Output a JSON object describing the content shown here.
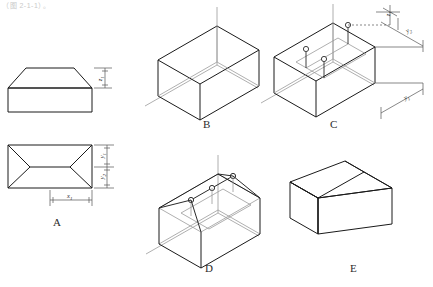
{
  "header": {
    "faint_text": "（图 2-1-1）。"
  },
  "diagram": {
    "stroke_color": "#1a1a1a",
    "light_stroke_color": "#8c8c8c",
    "figures": [
      {
        "id": "A",
        "label": "A",
        "caption": "Orthographic views: front elevation and plan",
        "dimensions": [
          {
            "name": "z1",
            "text": "z",
            "sub": "1",
            "view": "front-elevation",
            "position": "right"
          },
          {
            "name": "y1",
            "text": "y",
            "sub": "1",
            "view": "plan",
            "position": "right-upper"
          },
          {
            "name": "y2",
            "text": "y",
            "sub": "2",
            "view": "plan",
            "position": "right-lower"
          },
          {
            "name": "x1",
            "text": "x",
            "sub": "1",
            "view": "plan",
            "position": "bottom"
          }
        ]
      },
      {
        "id": "B",
        "label": "B",
        "caption": "Isometric bounding box with axes"
      },
      {
        "id": "C",
        "label": "C",
        "caption": "Locating ridge points by transferring dimensions",
        "dimensions": [
          {
            "name": "z1",
            "text": "z",
            "sub": "1",
            "position": "top"
          },
          {
            "name": "y2",
            "text": "y",
            "sub": "2",
            "position": "upper-right"
          },
          {
            "name": "y1",
            "text": "y",
            "sub": "1",
            "position": "lower-right"
          }
        ]
      },
      {
        "id": "D",
        "label": "D",
        "caption": "Drawing the ridge and hip lines"
      },
      {
        "id": "E",
        "label": "E",
        "caption": "Completed solid with hidden lines removed"
      }
    ]
  }
}
